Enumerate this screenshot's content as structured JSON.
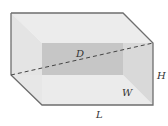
{
  "diagram": {
    "type": "rectangular-box",
    "labels": {
      "diagonal": "D",
      "height": "H",
      "width": "W",
      "length": "L"
    },
    "colors": {
      "edge": "#6e6e6e",
      "face_top": "#ececec",
      "face_left": "#e2e2e2",
      "face_back": "#c4c4c4",
      "face_front": "#e6e6e6",
      "face_right": "#d8d8d8",
      "diagonal": "#444444"
    }
  }
}
